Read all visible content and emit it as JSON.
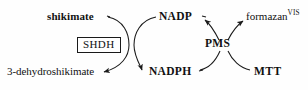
{
  "diagram": {
    "type": "reaction-scheme",
    "background_color": "#fefefe",
    "stroke_color": "#1a1a1a",
    "text_color": "#111111",
    "nodes": {
      "shikimate": {
        "label": "shikimate",
        "style": "bold",
        "role": "substrate"
      },
      "dehydroshikimate": {
        "label": "3-dehydroshikimate",
        "style": "normal",
        "role": "product"
      },
      "nadp": {
        "label": "NADP",
        "style": "bold",
        "role": "cofactor-oxidized"
      },
      "nadph": {
        "label": "NADPH",
        "style": "bold",
        "role": "cofactor-reduced"
      },
      "shdh": {
        "label": "SHDH",
        "style": "boxed",
        "role": "enzyme"
      },
      "pms": {
        "label": "PMS",
        "style": "bold",
        "role": "electron-mediator"
      },
      "mtt": {
        "label": "MTT",
        "style": "bold",
        "role": "tetrazolium-dye"
      },
      "formazan": {
        "label": "formazan",
        "superscript": "VIS",
        "style": "normal",
        "role": "chromogenic-product"
      }
    },
    "edges": [
      {
        "from": "shikimate",
        "to": "dehydroshikimate",
        "via": "shdh",
        "arrowhead": "end",
        "shape": "curve-left"
      },
      {
        "from": "nadp",
        "to": "nadph",
        "via": "shdh",
        "arrowhead": "end",
        "shape": "curve-right"
      },
      {
        "from": "nadph",
        "to": "nadp",
        "via": "pms",
        "arrowhead": "end",
        "shape": "curve-cross"
      },
      {
        "from": "mtt",
        "to": "formazan",
        "via": "pms",
        "arrowhead": "end",
        "shape": "curve-cross"
      }
    ]
  }
}
